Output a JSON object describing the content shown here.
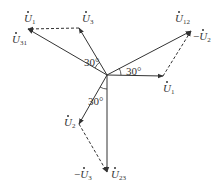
{
  "diagram": {
    "type": "phasor-diagram",
    "origin": [
      107,
      75
    ],
    "colors": {
      "line": "#333333",
      "background": "#ffffff"
    },
    "vectors": [
      {
        "id": "U1",
        "label": "U",
        "sub": "1",
        "prefix": "",
        "from": [
          107,
          75
        ],
        "to": [
          163,
          76
        ],
        "style": "solid"
      },
      {
        "id": "U2",
        "label": "U",
        "sub": "2",
        "prefix": "",
        "from": [
          107,
          75
        ],
        "to": [
          79,
          124
        ],
        "style": "solid"
      },
      {
        "id": "U3",
        "label": "U",
        "sub": "3",
        "prefix": "",
        "from": [
          107,
          75
        ],
        "to": [
          79,
          28
        ],
        "style": "solid"
      },
      {
        "id": "U12",
        "label": "U",
        "sub": "12",
        "prefix": "",
        "from": [
          107,
          75
        ],
        "to": [
          191,
          31
        ],
        "style": "solid"
      },
      {
        "id": "U23",
        "label": "U",
        "sub": "23",
        "prefix": "",
        "from": [
          107,
          75
        ],
        "to": [
          107,
          172
        ],
        "style": "solid"
      },
      {
        "id": "U31",
        "label": "U",
        "sub": "31",
        "prefix": "",
        "from": [
          107,
          75
        ],
        "to": [
          28,
          29
        ],
        "style": "solid"
      },
      {
        "id": "negU2",
        "label": "U",
        "sub": "2",
        "prefix": "−",
        "from": [
          163,
          76
        ],
        "to": [
          191,
          31
        ],
        "style": "dashed"
      },
      {
        "id": "negU3",
        "label": "U",
        "sub": "3",
        "prefix": "−",
        "from": [
          79,
          124
        ],
        "to": [
          107,
          172
        ],
        "style": "dashed"
      },
      {
        "id": "negU1",
        "label": "U",
        "sub": "1",
        "prefix": "",
        "from": [
          79,
          28
        ],
        "to": [
          28,
          29
        ],
        "style": "dashed"
      }
    ],
    "labels": [
      {
        "text": "U",
        "sub": "1",
        "prefix": "",
        "x": 24,
        "y": 22
      },
      {
        "text": "U",
        "sub": "31",
        "prefix": "",
        "x": 12,
        "y": 43
      },
      {
        "text": "U",
        "sub": "3",
        "prefix": "",
        "x": 82,
        "y": 22
      },
      {
        "text": "U",
        "sub": "12",
        "prefix": "",
        "x": 175,
        "y": 22
      },
      {
        "text": "U",
        "sub": "2",
        "prefix": "−",
        "x": 193,
        "y": 40
      },
      {
        "text": "U",
        "sub": "1",
        "prefix": "",
        "x": 163,
        "y": 92
      },
      {
        "text": "U",
        "sub": "2",
        "prefix": "",
        "x": 64,
        "y": 126
      },
      {
        "text": "U",
        "sub": "3",
        "prefix": "−",
        "x": 74,
        "y": 178
      },
      {
        "text": "U",
        "sub": "23",
        "prefix": "",
        "x": 111,
        "y": 178
      }
    ],
    "angles": [
      {
        "text": "30°",
        "x": 84,
        "y": 66
      },
      {
        "text": "30°",
        "x": 126,
        "y": 75
      },
      {
        "text": "30°",
        "x": 88,
        "y": 105
      }
    ]
  }
}
